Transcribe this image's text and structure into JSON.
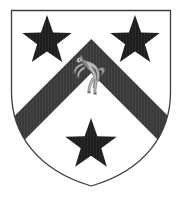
{
  "image": {
    "kind": "heraldic-achievement",
    "title": "Coat of Arms",
    "background_color": "#ffffff",
    "width": 183,
    "height": 204
  },
  "shield": {
    "name": "escutcheon",
    "field_label": "Argent",
    "field_color": "#ffffff",
    "outline_color": "#3d3d3d",
    "outline_width": 1.3,
    "top_left_x": 11,
    "top_right_x": 171,
    "top_y": 10,
    "bottom_point_x": 91,
    "bottom_point_y": 186
  },
  "ordinary": {
    "name": "chevron",
    "label": "Chevron",
    "tincture_label": "Sable",
    "color": "#3a3a3a",
    "apex_x": 91,
    "apex_y": 40,
    "thickness": 44
  },
  "charges": [
    {
      "name": "mullet-top-left",
      "label": "Mullet (5-pointed star)",
      "position": "dexter chief",
      "tincture_label": "Sable",
      "color": "#1e1e1e",
      "cx": 47,
      "cy": 41,
      "r": 26
    },
    {
      "name": "mullet-top-right",
      "label": "Mullet (5-pointed star)",
      "position": "sinister chief",
      "tincture_label": "Sable",
      "color": "#1e1e1e",
      "cx": 135,
      "cy": 41,
      "r": 26
    },
    {
      "name": "mullet-base",
      "label": "Mullet (5-pointed star)",
      "position": "base",
      "tincture_label": "Sable",
      "color": "#1e1e1e",
      "cx": 91,
      "cy": 145,
      "r": 27
    },
    {
      "name": "horse-rampant",
      "label": "Horse rampant",
      "position": "on the chevron, in chief",
      "tincture_label": "Argent",
      "color": "#b9b9b9",
      "outline_color": "#6e6e6e",
      "cx": 89,
      "cy": 72
    }
  ],
  "blazon": {
    "text": "Argent, a chevron sable between three mullets sable, on the chevron a horse rampant argent"
  }
}
